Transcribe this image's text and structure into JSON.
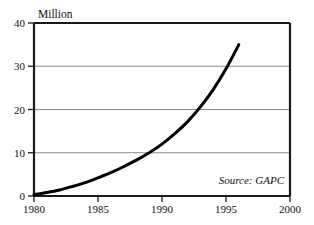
{
  "chart_data": {
    "type": "line",
    "title": "",
    "unit_label": "Million",
    "xlabel": "",
    "ylabel": "Million",
    "xlim": [
      1980,
      2000
    ],
    "ylim": [
      0,
      40
    ],
    "grid": true,
    "grid_axis": "y",
    "legend": "none",
    "annotations": [
      {
        "text": "Source: GAPC",
        "position": "bottom-right-inside",
        "style": "italic"
      }
    ],
    "x_ticks": [
      1980,
      1985,
      1990,
      1995,
      2000
    ],
    "x_tick_labels": [
      "1980",
      "1985",
      "1990",
      "1995",
      "2000"
    ],
    "y_ticks": [
      0,
      10,
      20,
      30,
      40
    ],
    "y_tick_labels": [
      "0",
      "10",
      "20",
      "30",
      "40"
    ],
    "series": [
      {
        "name": "Million",
        "color": "#000000",
        "line_width": 3,
        "x": [
          1980,
          1981,
          1982,
          1983,
          1984,
          1985,
          1986,
          1987,
          1988,
          1989,
          1990,
          1991,
          1992,
          1993,
          1994,
          1995,
          1996
        ],
        "values": [
          0.3,
          0.8,
          1.4,
          2.2,
          3.1,
          4.2,
          5.4,
          6.8,
          8.3,
          10.0,
          12.0,
          14.4,
          17.2,
          20.6,
          24.6,
          29.4,
          35.0
        ]
      }
    ]
  },
  "axes": {
    "y_label_0": "0",
    "y_label_10": "10",
    "y_label_20": "20",
    "y_label_30": "30",
    "y_label_40": "40",
    "x_label_1980": "1980",
    "x_label_1985": "1985",
    "x_label_1990": "1990",
    "x_label_1995": "1995",
    "x_label_2000": "2000"
  },
  "labels": {
    "unit": "Million",
    "source": "Source: GAPC"
  },
  "colors": {
    "curve": "#000000",
    "frame": "#1a1a1a",
    "gridline": "#8c8c8c",
    "text": "#111111",
    "background": "#ffffff"
  }
}
